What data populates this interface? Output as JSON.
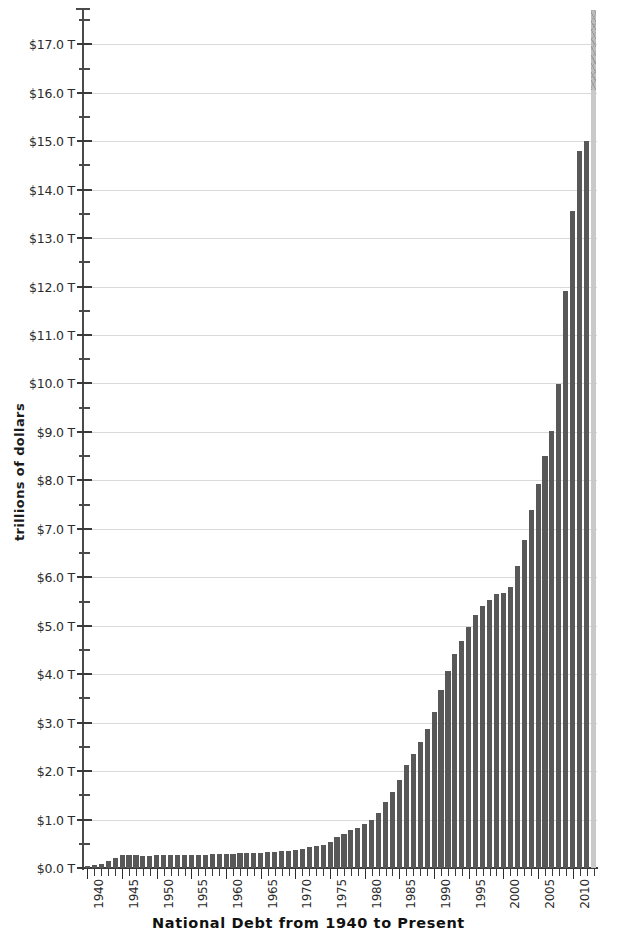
{
  "chart_data": {
    "type": "bar",
    "title": "",
    "xlabel": "National Debt from 1940 to Present",
    "ylabel": "trillions of dollars",
    "ylim": [
      0,
      17.75
    ],
    "ytick_step": 1.0,
    "yminor_step": 0.5,
    "grid": true,
    "legend": "none",
    "yticklabels": [
      "$0.0 T",
      "$1.0 T",
      "$2.0 T",
      "$3.0 T",
      "$4.0 T",
      "$5.0 T",
      "$6.0 T",
      "$7.0 T",
      "$8.0 T",
      "$9.0 T",
      "$10.0 T",
      "$11.0 T",
      "$12.0 T",
      "$13.0 T",
      "$14.0 T",
      "$15.0 T",
      "$16.0 T",
      "$17.0 T"
    ],
    "ytickvalues": [
      0,
      1,
      2,
      3,
      4,
      5,
      6,
      7,
      8,
      9,
      10,
      11,
      12,
      13,
      14,
      15,
      16,
      17
    ],
    "xticklabels": [
      "1940",
      "1945",
      "1950",
      "1955",
      "1960",
      "1965",
      "1970",
      "1975",
      "1980",
      "1985",
      "1990",
      "1995",
      "2000",
      "2005",
      "2010"
    ],
    "xtickvalues": [
      1940,
      1945,
      1950,
      1955,
      1960,
      1965,
      1970,
      1975,
      1980,
      1985,
      1990,
      1995,
      2000,
      2005,
      2010
    ],
    "xrange": [
      1939.5,
      2013.5
    ],
    "bar_color": "#585858",
    "projection_color": "#c9c9c9",
    "grid_color": "#d9d9d9",
    "axis_color": "#3a3a3a",
    "categories": [
      1940,
      1941,
      1942,
      1943,
      1944,
      1945,
      1946,
      1947,
      1948,
      1949,
      1950,
      1951,
      1952,
      1953,
      1954,
      1955,
      1956,
      1957,
      1958,
      1959,
      1960,
      1961,
      1962,
      1963,
      1964,
      1965,
      1966,
      1967,
      1968,
      1969,
      1970,
      1971,
      1972,
      1973,
      1974,
      1975,
      1976,
      1977,
      1978,
      1979,
      1980,
      1981,
      1982,
      1983,
      1984,
      1985,
      1986,
      1987,
      1988,
      1989,
      1990,
      1991,
      1992,
      1993,
      1994,
      1995,
      1996,
      1997,
      1998,
      1999,
      2000,
      2001,
      2002,
      2003,
      2004,
      2005,
      2006,
      2007,
      2008,
      2009,
      2010,
      2011,
      2012,
      2013
    ],
    "values": [
      0.05,
      0.06,
      0.08,
      0.14,
      0.2,
      0.26,
      0.27,
      0.26,
      0.25,
      0.25,
      0.26,
      0.26,
      0.26,
      0.27,
      0.27,
      0.27,
      0.27,
      0.27,
      0.28,
      0.28,
      0.29,
      0.29,
      0.3,
      0.31,
      0.32,
      0.32,
      0.33,
      0.34,
      0.35,
      0.35,
      0.37,
      0.4,
      0.43,
      0.46,
      0.48,
      0.54,
      0.63,
      0.71,
      0.78,
      0.83,
      0.91,
      1.0,
      1.14,
      1.37,
      1.56,
      1.82,
      2.12,
      2.35,
      2.6,
      2.86,
      3.23,
      3.67,
      4.06,
      4.41,
      4.69,
      4.97,
      5.22,
      5.41,
      5.53,
      5.66,
      5.67,
      5.81,
      6.23,
      6.78,
      7.38,
      7.93,
      8.51,
      9.01,
      9.99,
      11.91,
      13.56,
      14.79,
      15.0,
      17.7
    ],
    "projection_index": 73,
    "projection_note": "final light-gray bar (debt ceiling / projection)"
  }
}
